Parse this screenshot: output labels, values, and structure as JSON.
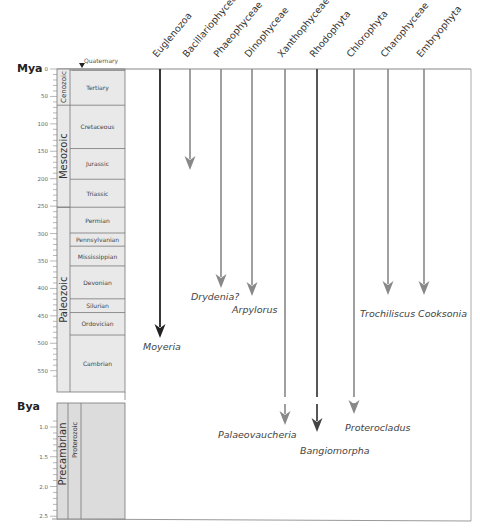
{
  "axis": {
    "mya_label": "Mya",
    "bya_label": "Bya",
    "mya_ticks": [
      "0",
      "50",
      "100",
      "150",
      "200",
      "250",
      "300",
      "350",
      "400",
      "450",
      "500",
      "550"
    ],
    "bya_ticks": [
      "1.0",
      "1.5",
      "2.0",
      "2.5"
    ]
  },
  "time_scale": {
    "quaternary_label": "Quaternary",
    "eras": [
      {
        "label": "Cenozoic",
        "top": 0,
        "bottom": 66
      },
      {
        "label": "Mesozoic",
        "top": 66,
        "bottom": 252
      },
      {
        "label": "Paleozoic",
        "top": 252,
        "bottom": 575
      }
    ],
    "periods": [
      {
        "label": "Tertiary",
        "top": 2,
        "bottom": 66
      },
      {
        "label": "Cretaceous",
        "top": 66,
        "bottom": 145
      },
      {
        "label": "Jurassic",
        "top": 145,
        "bottom": 201
      },
      {
        "label": "Triassic",
        "top": 201,
        "bottom": 252
      },
      {
        "label": "Permian",
        "top": 252,
        "bottom": 299
      },
      {
        "label": "Pennsylvanian",
        "top": 299,
        "bottom": 323
      },
      {
        "label": "Mississippian",
        "top": 323,
        "bottom": 359
      },
      {
        "label": "Devonian",
        "top": 359,
        "bottom": 419
      },
      {
        "label": "Silurian",
        "top": 419,
        "bottom": 444
      },
      {
        "label": "Ordovician",
        "top": 444,
        "bottom": 485
      },
      {
        "label": "Cambrian",
        "top": 485,
        "bottom": 541
      }
    ],
    "precambrian": {
      "eon_label": "Precambrian",
      "era_label": "Proterozoic"
    }
  },
  "lineages": [
    {
      "name": "Euglenozoa",
      "x": 160,
      "arrow_y": 338,
      "color": "#222222",
      "fossil": "Moyeria",
      "fossil_x": 143,
      "fossil_y": 350
    },
    {
      "name": "Bacillariophyceae",
      "x": 190,
      "arrow_y": 170,
      "color": "#888888",
      "fossil": "",
      "fossil_x": 0,
      "fossil_y": 0
    },
    {
      "name": "Phaeophyceae",
      "x": 221,
      "arrow_y": 288,
      "color": "#888888",
      "fossil": "Drydenia?",
      "fossil_x": 191,
      "fossil_y": 300
    },
    {
      "name": "Dinophyceae",
      "x": 252,
      "arrow_y": 296,
      "color": "#888888",
      "fossil": "Arpylorus",
      "fossil_x": 232,
      "fossil_y": 313
    },
    {
      "name": "Xanthophyceae",
      "x": 285,
      "arrow_y": 425,
      "color": "#888888",
      "fossil": "Palaeovaucheria",
      "fossil_x": 218,
      "fossil_y": 438
    },
    {
      "name": "Rhodophyta",
      "x": 317,
      "arrow_y": 432,
      "color": "#444444",
      "fossil": "Bangiomorpha",
      "fossil_x": 300,
      "fossil_y": 454
    },
    {
      "name": "Chlorophyta",
      "x": 354,
      "arrow_y": 414,
      "color": "#888888",
      "fossil": "Proterocladus",
      "fossil_x": 345,
      "fossil_y": 431
    },
    {
      "name": "Charophyceae",
      "x": 388,
      "arrow_y": 295,
      "color": "#888888",
      "fossil": "Trochiliscus",
      "fossil_x": 360,
      "fossil_y": 317
    },
    {
      "name": "Embryophyta",
      "x": 424,
      "arrow_y": 295,
      "color": "#888888",
      "fossil": "Cooksonia",
      "fossil_x": 418,
      "fossil_y": 317
    }
  ],
  "colors": {
    "scale_fill": "#e9e9e9",
    "scale_stroke": "#777777",
    "frame": "#999999",
    "label": "#444444",
    "dark_arrow": "#222222",
    "grey_arrow": "#8a8a8a"
  }
}
